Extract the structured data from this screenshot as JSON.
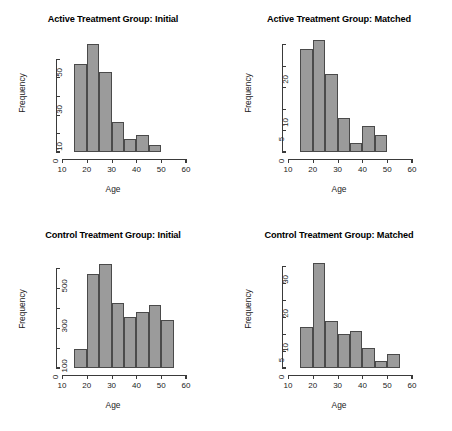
{
  "figure": {
    "background": "#ffffff",
    "bar_fill": "#9b9b9b",
    "bar_border": "#4a4a4a",
    "axis_color": "#3a3a3a",
    "caption_partial": ""
  },
  "chart_data": [
    {
      "type": "bar",
      "panel": "top-left",
      "title": "Active Treatment Group: Initial",
      "xlabel": "Age",
      "ylabel": "Frequency",
      "xlim": [
        10,
        60
      ],
      "ylim": [
        0,
        60
      ],
      "xticks": [
        10,
        20,
        30,
        40,
        50,
        60
      ],
      "xticklabels": [
        "10",
        "20",
        "30",
        "40",
        "50",
        "60"
      ],
      "yticks": [
        0,
        10,
        20,
        30,
        40,
        50
      ],
      "yticklabels": [
        "0",
        "10",
        "",
        "30",
        "",
        "50"
      ],
      "grid": false,
      "legend": false,
      "bin_width": 5,
      "bin_edges": [
        15,
        20,
        25,
        30,
        35,
        40,
        45,
        50
      ],
      "categories": [
        "15-20",
        "20-25",
        "25-30",
        "30-35",
        "35-40",
        "40-45",
        "45-50"
      ],
      "values": [
        47,
        58,
        43,
        16,
        7,
        9,
        4
      ]
    },
    {
      "type": "bar",
      "panel": "top-right",
      "title": "Active Treatment Group: Matched",
      "xlabel": "Age",
      "ylabel": "Frequency",
      "xlim": [
        10,
        60
      ],
      "ylim": [
        0,
        26
      ],
      "xticks": [
        10,
        20,
        30,
        40,
        50,
        60
      ],
      "xticklabels": [
        "10",
        "20",
        "30",
        "40",
        "50",
        "60"
      ],
      "yticks": [
        0,
        5,
        10,
        15,
        20,
        25
      ],
      "yticklabels": [
        "0",
        "5",
        "10",
        "",
        "20",
        ""
      ],
      "grid": false,
      "legend": false,
      "bin_width": 5,
      "bin_edges": [
        15,
        20,
        25,
        30,
        35,
        40,
        45,
        50
      ],
      "categories": [
        "15-20",
        "20-25",
        "25-30",
        "30-35",
        "35-40",
        "40-45",
        "45-50"
      ],
      "values": [
        24,
        26,
        18,
        8,
        2,
        6,
        4
      ]
    },
    {
      "type": "bar",
      "panel": "bottom-left",
      "title": "Control Treatment Group: Initial",
      "xlabel": "Age",
      "ylabel": "Frequency",
      "xlim": [
        10,
        60
      ],
      "ylim": [
        0,
        560
      ],
      "xticks": [
        10,
        20,
        30,
        40,
        50,
        60
      ],
      "xticklabels": [
        "10",
        "20",
        "30",
        "40",
        "50",
        "60"
      ],
      "yticks": [
        0,
        100,
        200,
        300,
        400,
        500
      ],
      "yticklabels": [
        "0",
        "100",
        "",
        "300",
        "",
        "500"
      ],
      "grid": false,
      "legend": false,
      "bin_width": 5,
      "bin_edges": [
        15,
        20,
        25,
        30,
        35,
        40,
        45,
        50,
        55
      ],
      "categories": [
        "15-20",
        "20-25",
        "25-30",
        "30-35",
        "35-40",
        "40-45",
        "45-50",
        "50-55"
      ],
      "values": [
        95,
        470,
        520,
        325,
        255,
        280,
        315,
        240
      ]
    },
    {
      "type": "bar",
      "panel": "bottom-right",
      "title": "Control Treatment Group: Matched",
      "xlabel": "Age",
      "ylabel": "Frequency",
      "xlim": [
        10,
        60
      ],
      "ylim": [
        0,
        33
      ],
      "xticks": [
        10,
        20,
        30,
        40,
        50,
        60
      ],
      "xticklabels": [
        "10",
        "20",
        "30",
        "40",
        "50",
        "60"
      ],
      "yticks": [
        0,
        5,
        10,
        15,
        20,
        25,
        30
      ],
      "yticklabels": [
        "0",
        "5",
        "10",
        "",
        "20",
        "",
        "30"
      ],
      "grid": false,
      "legend": false,
      "bin_width": 5,
      "bin_edges": [
        15,
        20,
        25,
        30,
        35,
        40,
        45,
        50,
        55
      ],
      "categories": [
        "15-20",
        "20-25",
        "25-30",
        "30-35",
        "35-40",
        "40-45",
        "45-50",
        "50-55"
      ],
      "values": [
        12,
        31,
        14,
        10,
        11,
        6,
        2,
        4
      ]
    }
  ]
}
